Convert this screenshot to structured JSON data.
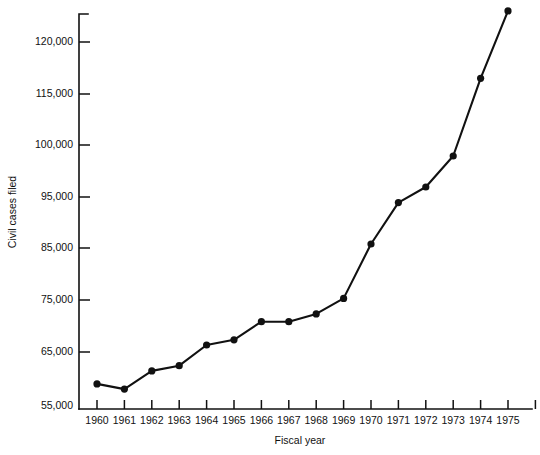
{
  "chart_data": {
    "type": "line",
    "title": "",
    "xlabel": "Fiscal year",
    "ylabel": "Civil cases filed",
    "grid": false,
    "legend": false,
    "legend_position": "none",
    "line_color": "#111111",
    "marker_color": "#111111",
    "marker_shape": "circle",
    "categories": [
      "1960",
      "1961",
      "1962",
      "1963",
      "1964",
      "1965",
      "1966",
      "1967",
      "1968",
      "1969",
      "1970",
      "1971",
      "1972",
      "1973",
      "1974",
      "1975"
    ],
    "x": [
      1960,
      1961,
      1962,
      1963,
      1964,
      1965,
      1966,
      1967,
      1968,
      1969,
      1970,
      1971,
      1972,
      1973,
      1974,
      1975
    ],
    "values": [
      59000,
      58000,
      61500,
      62500,
      66500,
      67500,
      71000,
      71000,
      72500,
      75500,
      86000,
      94000,
      96000,
      99000,
      116500,
      123000
    ],
    "series": [
      {
        "name": "Civil cases filed",
        "values": [
          59000,
          58000,
          61500,
          62500,
          66500,
          67500,
          71000,
          71000,
          72500,
          75500,
          86000,
          94000,
          96000,
          99000,
          116500,
          123000
        ]
      }
    ],
    "ytick_labels": [
      "120,000",
      "115,000",
      "100,000",
      "95,000",
      "85,000",
      "75,000",
      "65,000",
      "55,000"
    ],
    "ytick_values": [
      120000,
      115000,
      100000,
      95000,
      85000,
      75000,
      65000,
      55000
    ],
    "xtick_labels": [
      "1960",
      "1961",
      "1962",
      "1963",
      "1964",
      "1965",
      "1966",
      "1967",
      "1968",
      "1969",
      "1970",
      "1971",
      "1972",
      "1973",
      "1974",
      "1975"
    ],
    "ylim": [
      55000,
      125000
    ],
    "xlim": [
      1959.5,
      1976.0
    ]
  }
}
